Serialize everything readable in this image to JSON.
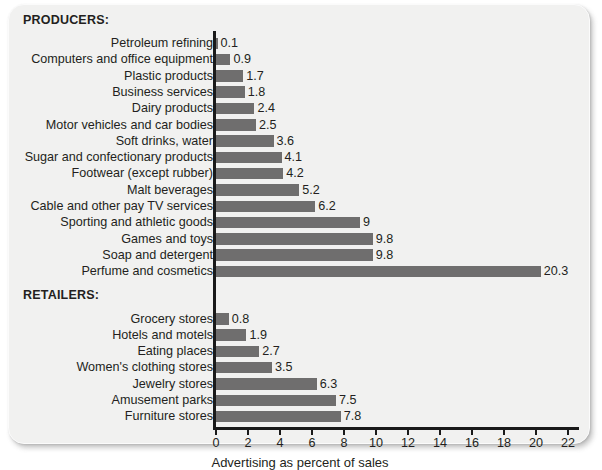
{
  "card": {
    "background_color": "#f1f1f0",
    "bar_color": "#6f6e6e",
    "axis_color": "#1a1a1a",
    "text_color": "#231f20"
  },
  "sections": {
    "producers_heading": "PRODUCERS:",
    "retailers_heading": "RETAILERS:"
  },
  "axis": {
    "title": "Advertising as percent of sales",
    "ticks": [
      "0",
      "2",
      "4",
      "6",
      "8",
      "10",
      "12",
      "14",
      "16",
      "18",
      "20",
      "22"
    ]
  },
  "chart_data": {
    "type": "bar",
    "orientation": "horizontal",
    "title": "",
    "subtitle": "",
    "xlabel": "Advertising as percent of sales",
    "ylabel": "",
    "xlim": [
      0,
      22
    ],
    "xticks": [
      0,
      2,
      4,
      6,
      8,
      10,
      12,
      14,
      16,
      18,
      20,
      22
    ],
    "grid": false,
    "legend": null,
    "value_labels": true,
    "groups": [
      {
        "name": "PRODUCERS:",
        "categories": [
          "Petroleum refining",
          "Computers and office equipment",
          "Plastic products",
          "Business services",
          "Dairy products",
          "Motor vehicles and car bodies",
          "Soft drinks, water",
          "Sugar and confectionary products",
          "Footwear (except rubber)",
          "Malt beverages",
          "Cable and other pay TV services",
          "Sporting and athletic goods",
          "Games and toys",
          "Soap and detergent",
          "Perfume and cosmetics"
        ],
        "values": [
          0.1,
          0.9,
          1.7,
          1.8,
          2.4,
          2.5,
          3.6,
          4.1,
          4.2,
          5.2,
          6.2,
          9,
          9.8,
          9.8,
          20.3
        ],
        "value_text": [
          "0.1",
          "0.9",
          "1.7",
          "1.8",
          "2.4",
          "2.5",
          "3.6",
          "4.1",
          "4.2",
          "5.2",
          "6.2",
          "9",
          "9.8",
          "9.8",
          "20.3"
        ]
      },
      {
        "name": "RETAILERS:",
        "categories": [
          "Grocery stores",
          "Hotels and motels",
          "Eating places",
          "Women's clothing stores",
          "Jewelry stores",
          "Amusement parks",
          "Furniture stores"
        ],
        "values": [
          0.8,
          1.9,
          2.7,
          3.5,
          6.3,
          7.5,
          7.8
        ],
        "value_text": [
          "0.8",
          "1.9",
          "2.7",
          "3.5",
          "6.3",
          "7.5",
          "7.8"
        ]
      }
    ]
  }
}
